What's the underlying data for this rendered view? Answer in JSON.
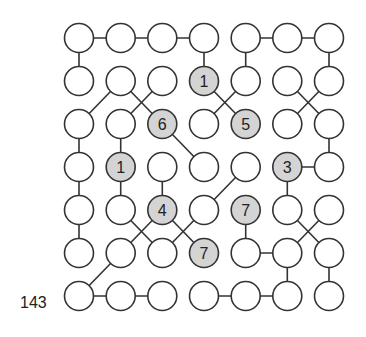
{
  "puzzle": {
    "id_label": "143",
    "rows": 7,
    "cols": 7,
    "colors": {
      "stroke": "#333333",
      "empty_fill": "#ffffff",
      "clue_fill": "#d4d4d4",
      "text": "#222222"
    },
    "grid": [
      [
        "",
        "",
        "",
        "",
        "",
        "",
        ""
      ],
      [
        "",
        "",
        "",
        "1",
        "",
        "",
        ""
      ],
      [
        "",
        "",
        "6",
        "",
        "5",
        "",
        ""
      ],
      [
        "",
        "1",
        "",
        "",
        "",
        "3",
        ""
      ],
      [
        "",
        "",
        "4",
        "",
        "7",
        "",
        ""
      ],
      [
        "",
        "",
        "",
        "7",
        "",
        "",
        ""
      ],
      [
        "",
        "",
        "",
        "",
        "",
        "",
        ""
      ]
    ],
    "edges": [
      [
        [
          0,
          0
        ],
        [
          0,
          1
        ]
      ],
      [
        [
          0,
          1
        ],
        [
          0,
          2
        ]
      ],
      [
        [
          0,
          2
        ],
        [
          0,
          3
        ]
      ],
      [
        [
          0,
          4
        ],
        [
          0,
          5
        ]
      ],
      [
        [
          0,
          5
        ],
        [
          0,
          6
        ]
      ],
      [
        [
          0,
          0
        ],
        [
          1,
          0
        ]
      ],
      [
        [
          0,
          3
        ],
        [
          1,
          3
        ]
      ],
      [
        [
          0,
          4
        ],
        [
          1,
          4
        ]
      ],
      [
        [
          0,
          6
        ],
        [
          1,
          6
        ]
      ],
      [
        [
          1,
          1
        ],
        [
          2,
          0
        ]
      ],
      [
        [
          1,
          1
        ],
        [
          2,
          2
        ]
      ],
      [
        [
          1,
          2
        ],
        [
          2,
          1
        ]
      ],
      [
        [
          1,
          3
        ],
        [
          2,
          4
        ]
      ],
      [
        [
          1,
          4
        ],
        [
          2,
          3
        ]
      ],
      [
        [
          1,
          5
        ],
        [
          2,
          6
        ]
      ],
      [
        [
          1,
          6
        ],
        [
          2,
          5
        ]
      ],
      [
        [
          2,
          0
        ],
        [
          3,
          0
        ]
      ],
      [
        [
          2,
          1
        ],
        [
          3,
          1
        ]
      ],
      [
        [
          2,
          2
        ],
        [
          3,
          3
        ]
      ],
      [
        [
          2,
          6
        ],
        [
          3,
          6
        ]
      ],
      [
        [
          3,
          5
        ],
        [
          3,
          6
        ]
      ],
      [
        [
          3,
          0
        ],
        [
          4,
          0
        ]
      ],
      [
        [
          3,
          1
        ],
        [
          4,
          1
        ]
      ],
      [
        [
          3,
          2
        ],
        [
          4,
          2
        ]
      ],
      [
        [
          3,
          4
        ],
        [
          4,
          3
        ]
      ],
      [
        [
          3,
          5
        ],
        [
          4,
          5
        ]
      ],
      [
        [
          4,
          0
        ],
        [
          5,
          0
        ]
      ],
      [
        [
          4,
          1
        ],
        [
          5,
          2
        ]
      ],
      [
        [
          4,
          2
        ],
        [
          5,
          1
        ]
      ],
      [
        [
          4,
          2
        ],
        [
          5,
          3
        ]
      ],
      [
        [
          4,
          3
        ],
        [
          5,
          2
        ]
      ],
      [
        [
          4,
          4
        ],
        [
          5,
          4
        ]
      ],
      [
        [
          4,
          5
        ],
        [
          5,
          6
        ]
      ],
      [
        [
          4,
          6
        ],
        [
          5,
          5
        ]
      ],
      [
        [
          5,
          4
        ],
        [
          5,
          5
        ]
      ],
      [
        [
          5,
          1
        ],
        [
          6,
          0
        ]
      ],
      [
        [
          5,
          5
        ],
        [
          6,
          5
        ]
      ],
      [
        [
          5,
          6
        ],
        [
          6,
          6
        ]
      ],
      [
        [
          6,
          0
        ],
        [
          6,
          1
        ]
      ],
      [
        [
          6,
          1
        ],
        [
          6,
          2
        ]
      ],
      [
        [
          6,
          3
        ],
        [
          6,
          4
        ]
      ],
      [
        [
          6,
          4
        ],
        [
          6,
          5
        ]
      ]
    ],
    "layout": {
      "col_x": [
        79,
        120.7,
        162.3,
        204,
        245.7,
        287.3,
        329
      ],
      "row_y": [
        38,
        81,
        124,
        167,
        210,
        253,
        296
      ],
      "radius": 14.5
    }
  }
}
